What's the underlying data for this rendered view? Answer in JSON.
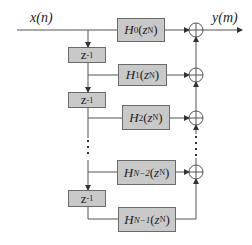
{
  "diagram": {
    "input_label": "x(n)",
    "output_label": "y(m)",
    "delay_label": "z",
    "delay_exponent": "-1",
    "filters": [
      {
        "name": "H",
        "sub": "0",
        "arg": "z",
        "exp": "N"
      },
      {
        "name": "H",
        "sub": "1",
        "arg": "z",
        "exp": "N"
      },
      {
        "name": "H",
        "sub": "2",
        "arg": "z",
        "exp": "N"
      },
      {
        "name": "H",
        "sub": "N−2",
        "arg": "z",
        "exp": "N"
      },
      {
        "name": "H",
        "sub": "N−1",
        "arg": "z",
        "exp": "N"
      }
    ],
    "adder_symbol": "⊕",
    "colors": {
      "block_fill": "#c9c9c9",
      "block_border": "#6a6a6a",
      "line": "#555555",
      "text": "#222222"
    }
  }
}
